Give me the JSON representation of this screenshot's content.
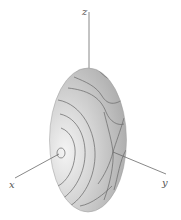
{
  "figure": {
    "type": "3d-surface-ellipsoid-with-contours",
    "axes": {
      "x": {
        "label": "x"
      },
      "y": {
        "label": "y"
      },
      "z": {
        "label": "z"
      }
    },
    "colors": {
      "surface_light": "#f2f2f2",
      "surface_mid": "#cfcfcf",
      "surface_dark": "#a9a9a9",
      "contour": "#6e6e6e",
      "axis": "#6a6a6a"
    }
  }
}
